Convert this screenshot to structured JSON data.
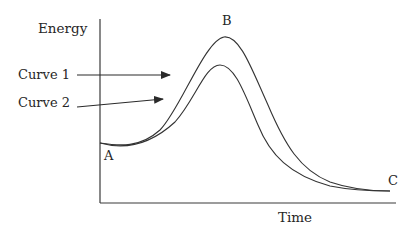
{
  "diagram": {
    "type": "energy-profile",
    "axes": {
      "y_label": "Energy",
      "x_label": "Time"
    },
    "curve_labels": {
      "curve1": "Curve 1",
      "curve2": "Curve 2"
    },
    "points": {
      "A": "A",
      "B": "B",
      "C": "C"
    },
    "colors": {
      "line": "#333333",
      "text": "#262626",
      "background": "#ffffff"
    },
    "curves": [
      {
        "name": "Curve 1",
        "description": "Higher peak at B",
        "path": "M100,143 C120,146 140,148 160,130 C180,110 205,40 224,37 C240,35 252,70 268,105 C285,145 300,170 330,182 C350,189 370,191 390,191"
      },
      {
        "name": "Curve 2",
        "description": "Lower peak",
        "path": "M100,143 C125,150 150,145 175,122 C195,100 205,65 220,65 C235,65 245,95 258,125 C270,155 290,175 330,186 C355,191 375,191 390,191"
      }
    ],
    "arrows": [
      {
        "from": [
          77,
          75
        ],
        "to": [
          170,
          75
        ],
        "target": "Curve 1"
      },
      {
        "from": [
          77,
          107
        ],
        "to": [
          163,
          99
        ],
        "target": "Curve 2"
      }
    ]
  }
}
